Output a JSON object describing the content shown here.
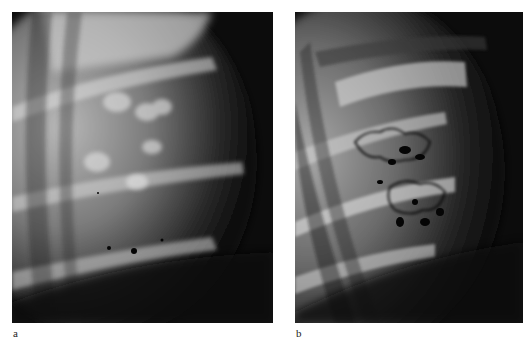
{
  "figure": {
    "panels": [
      {
        "id": "a",
        "label": "a",
        "description": "Radiograph showing mottled rib-cage soft tissue densities with small dark contrast dots near lower rib"
      },
      {
        "id": "b",
        "label": "b",
        "description": "Radiograph showing contrast-outlined lobulated structures between ribs"
      }
    ]
  }
}
